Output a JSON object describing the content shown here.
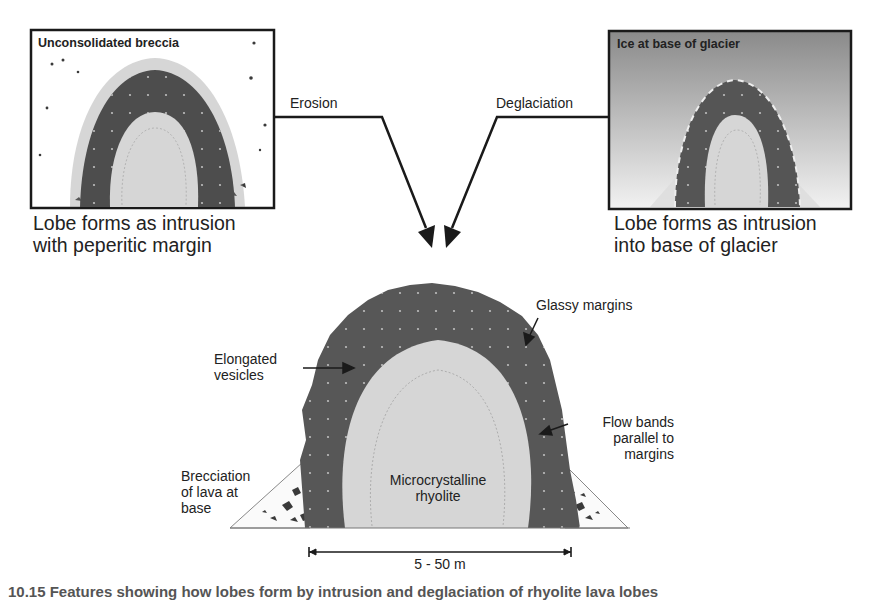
{
  "panels": {
    "left": {
      "title": "Unconsolidated breccia",
      "caption_lines": [
        "Lobe forms as intrusion",
        "with peperitic margin"
      ]
    },
    "right": {
      "title": "Ice at base of glacier",
      "caption_lines": [
        "Lobe forms as intrusion",
        "into base of glacier"
      ]
    }
  },
  "arrows": {
    "left_label": "Erosion",
    "right_label": "Deglaciation"
  },
  "main": {
    "labels": {
      "glassy_margins": "Glassy margins",
      "elongated_vesicles": [
        "Elongated",
        "vesicles"
      ],
      "flow_bands": [
        "Flow bands",
        "parallel to",
        "margins"
      ],
      "brecciation": [
        "Brecciation",
        "of lava at",
        "base"
      ],
      "core": [
        "Microcrystalline",
        "rhyolite"
      ]
    },
    "scale_bar": "5 - 50 m"
  },
  "figure_caption": "10.15 Features showing how lobes form by intrusion and deglaciation of rhyolite lava lobes",
  "colors": {
    "margin_dark": "#5a5a5a",
    "core_light": "#d9d9d9",
    "ice_top": "#8c8c8c",
    "ice_bottom": "#efefef",
    "outline": "#1a1a1a"
  }
}
